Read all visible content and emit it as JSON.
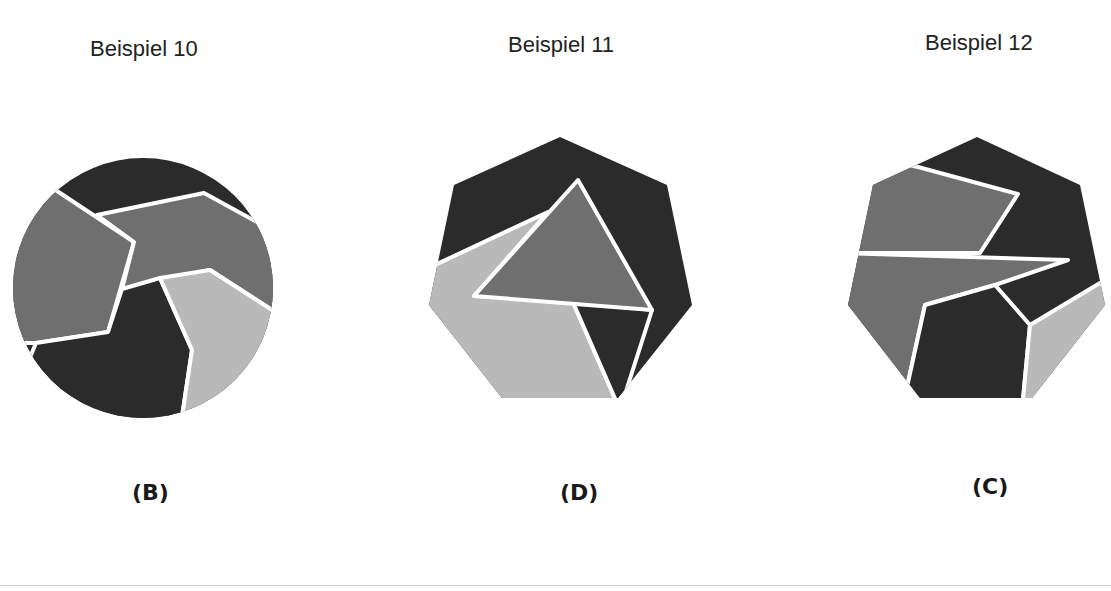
{
  "colors": {
    "dark": "#2b2b2b",
    "mid": "#6f6f6f",
    "light": "#b9b9b9",
    "separator": "#ffffff",
    "text": "#222222",
    "rule": "#cfcfcf"
  },
  "examples": [
    {
      "title": "Beispiel 10",
      "answer": "(B)",
      "shape": "circle",
      "pieces": [
        {
          "name": "top-dark",
          "shade": "dark"
        },
        {
          "name": "left-pentagon",
          "shade": "mid"
        },
        {
          "name": "center-band",
          "shade": "mid"
        },
        {
          "name": "bottom-dark",
          "shade": "dark"
        },
        {
          "name": "bottom-right-light",
          "shade": "light"
        }
      ]
    },
    {
      "title": "Beispiel 11",
      "answer": "(D)",
      "shape": "heptagon",
      "pieces": [
        {
          "name": "top-dark",
          "shade": "dark"
        },
        {
          "name": "center-triangle",
          "shade": "mid"
        },
        {
          "name": "lower-left-light",
          "shade": "light"
        },
        {
          "name": "lower-right-dark",
          "shade": "dark"
        }
      ]
    },
    {
      "title": "Beispiel 12",
      "answer": "(C)",
      "shape": "heptagon",
      "pieces": [
        {
          "name": "top-right-dark",
          "shade": "dark"
        },
        {
          "name": "upper-left-mid",
          "shade": "mid"
        },
        {
          "name": "middle-wedge-mid",
          "shade": "mid"
        },
        {
          "name": "bottom-center-dark",
          "shade": "dark"
        },
        {
          "name": "bottom-right-light",
          "shade": "light"
        }
      ]
    }
  ]
}
